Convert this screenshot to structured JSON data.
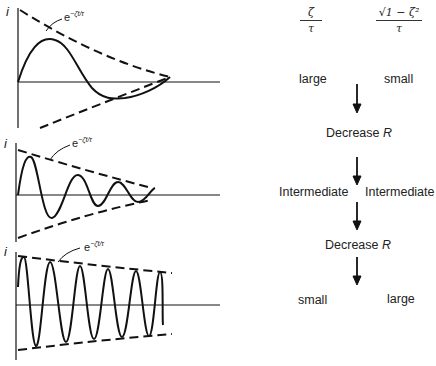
{
  "plots": [
    {
      "axis_label": "i",
      "envelope_label": "e",
      "envelope_exp": "−ζt/τ",
      "case": "overdamped-like (large ζ/τ, small √(1−ζ²)/τ)"
    },
    {
      "axis_label": "i",
      "envelope_label": "e",
      "envelope_exp": "−ζt/τ",
      "case": "intermediate"
    },
    {
      "axis_label": "i",
      "envelope_label": "e",
      "envelope_exp": "−ζt/τ",
      "case": "lightly damped (small ζ/τ, large √(1−ζ²)/τ)"
    }
  ],
  "header": {
    "col1_num": "ζ",
    "col1_den": "τ",
    "col2_num": "√1 − ζ²",
    "col2_den": "τ"
  },
  "rows": [
    {
      "left": "large",
      "right": "small"
    },
    {
      "action": "Decrease",
      "action_var": "R"
    },
    {
      "left": "Intermediate",
      "right": "Intermediate"
    },
    {
      "action": "Decrease",
      "action_var": "R"
    },
    {
      "left": "small",
      "right": "large"
    }
  ]
}
